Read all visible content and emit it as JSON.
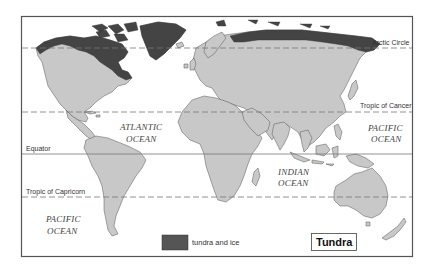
{
  "map": {
    "title": "Tundra",
    "legend": {
      "items": [
        {
          "label": "tundra and ice",
          "color": "#444444"
        }
      ]
    },
    "colors": {
      "land": "#c8c8c8",
      "tundra": "#444444",
      "water": "#ffffff",
      "frame": "#555555",
      "lines": "#777777"
    },
    "reference_lines": {
      "arctic_circle": "Arctic Circle",
      "tropic_of_cancer": "Tropic of Cancer",
      "equator": "Equator",
      "tropic_of_capricorn": "Tropic of Capricorn"
    },
    "oceans": {
      "atlantic_line1": "ATLANTIC",
      "atlantic_line2": "OCEAN",
      "pacific_east_line1": "PACIFIC",
      "pacific_east_line2": "OCEAN",
      "indian_line1": "INDIAN",
      "indian_line2": "OCEAN",
      "pacific_west_line1": "PACIFIC",
      "pacific_west_line2": "OCEAN"
    }
  }
}
